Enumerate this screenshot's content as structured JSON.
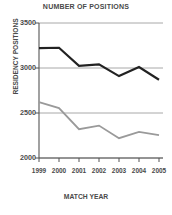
{
  "chart_data": {
    "type": "line",
    "title": "NUMBER OF POSITIONS",
    "xlabel": "MATCH YEAR",
    "ylabel": "RESIDENCY POSITIONS",
    "categories": [
      "1999",
      "2000",
      "2001",
      "2002",
      "2003",
      "2004",
      "2005"
    ],
    "x": [
      1999,
      2000,
      2001,
      2002,
      2003,
      2004,
      2005
    ],
    "ylim": [
      2000,
      3500
    ],
    "yticks": [
      3500,
      3000,
      2500,
      2000
    ],
    "ytick_labels": [
      "3500",
      "3000",
      "2500",
      "2000"
    ],
    "grid": true,
    "grid_axis": "y",
    "legend": "none",
    "series": [
      {
        "name": "upper-series",
        "color": "#222222",
        "width": 2.2,
        "values": [
          3220,
          3225,
          3025,
          3040,
          2910,
          3010,
          2870
        ]
      },
      {
        "name": "lower-series",
        "color": "#9a9a9a",
        "width": 1.8,
        "values": [
          2620,
          2555,
          2320,
          2360,
          2220,
          2290,
          2255
        ]
      }
    ]
  },
  "colors": {
    "axis": "#555555",
    "grid": "#a8a8a8",
    "text": "#4a4a4a",
    "background": "#ffffff"
  }
}
